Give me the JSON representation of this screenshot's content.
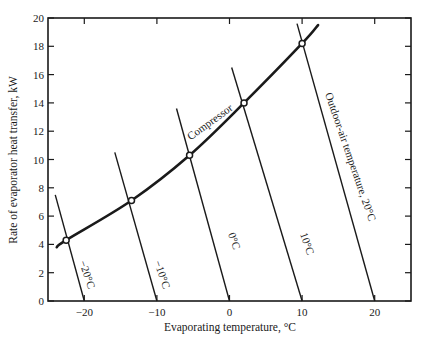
{
  "chart_data": {
    "type": "line",
    "title": "",
    "xlabel": "Evaporating temperature, °C",
    "ylabel": "Rate of evaporator heat transfer, kW",
    "xlim": [
      -25,
      25
    ],
    "ylim": [
      0,
      20
    ],
    "x_ticks": [
      -20,
      -10,
      0,
      10,
      20
    ],
    "x_tick_labels": [
      "−20",
      "−10",
      "0",
      "10",
      "20"
    ],
    "y_ticks": [
      0,
      2,
      4,
      6,
      8,
      10,
      12,
      14,
      16,
      18,
      20
    ],
    "y_tick_labels": [
      "0",
      "2",
      "4",
      "6",
      "8",
      "10",
      "12",
      "14",
      "16",
      "18",
      "20"
    ],
    "grid": false,
    "legend": "none (inline annotations)",
    "series": [
      {
        "name": "Compressor",
        "style": "thick curve",
        "x": [
          -23.8,
          -22.5,
          -13.5,
          -5.5,
          2,
          10,
          12.2
        ],
        "y": [
          3.8,
          4.3,
          7.1,
          10.3,
          14.0,
          18.2,
          19.5
        ]
      },
      {
        "name": "Outdoor-air temperature −20°C",
        "x": [
          -24,
          -20
        ],
        "y": [
          7.5,
          0
        ]
      },
      {
        "name": "Outdoor-air temperature −10°C",
        "x": [
          -15.8,
          -10
        ],
        "y": [
          10.5,
          0
        ]
      },
      {
        "name": "Outdoor-air temperature 0°C",
        "x": [
          -7.3,
          0
        ],
        "y": [
          13.6,
          0
        ]
      },
      {
        "name": "Outdoor-air temperature 10°C",
        "x": [
          0.3,
          10
        ],
        "y": [
          16.5,
          0
        ]
      },
      {
        "name": "Outdoor-air temperature 20°C",
        "x": [
          9.3,
          20
        ],
        "y": [
          19.6,
          0
        ]
      }
    ],
    "balance_points": [
      {
        "outdoor_temp_c": -20,
        "evap_temp_c": -22.5,
        "kw": 4.3
      },
      {
        "outdoor_temp_c": -10,
        "evap_temp_c": -13.5,
        "kw": 7.1
      },
      {
        "outdoor_temp_c": 0,
        "evap_temp_c": -5.5,
        "kw": 10.3
      },
      {
        "outdoor_temp_c": 10,
        "evap_temp_c": 2,
        "kw": 14.0
      },
      {
        "outdoor_temp_c": 20,
        "evap_temp_c": 10,
        "kw": 18.2
      }
    ],
    "annotations": [
      "Compressor",
      "−20°C",
      "−10°C",
      "0°C",
      "10°C",
      "Outdoor-air temperature, 20°C"
    ]
  },
  "labels": {
    "xlabel": "Evaporating temperature, °C",
    "ylabel": "Rate of evaporator heat transfer, kW",
    "compressor": "Compressor",
    "line_m20": "−20°C",
    "line_m10": "−10°C",
    "line_0": "0°C",
    "line_10": "10°C",
    "line_20": "Outdoor-air temperature, 20°C"
  },
  "colors": {
    "ink": "#1a1a1a",
    "background": "#ffffff"
  }
}
